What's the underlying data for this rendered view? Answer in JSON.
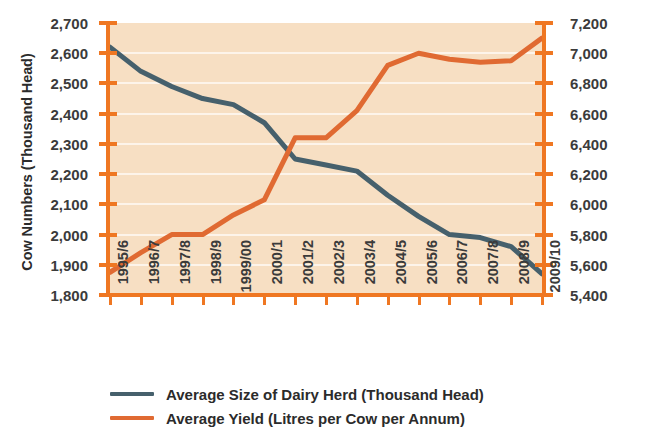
{
  "chart_data": {
    "type": "line",
    "title": "",
    "xlabel": "",
    "ylabel": "Cow Numbers (Thousand Head)",
    "y2label": "",
    "grid": true,
    "legend_position": "bottom-left",
    "plot_background": "#f7dfc3",
    "gridline_color": "#fdf4ea",
    "axis_color": "#ef7722",
    "categories": [
      "1995/6",
      "1996/7",
      "1997/8",
      "1998/9",
      "1999/00",
      "2000/1",
      "2001/2",
      "2002/3",
      "2003/4",
      "2004/5",
      "2005/6",
      "2006/7",
      "2007/8",
      "2008/9",
      "2009/10"
    ],
    "left_axis": {
      "label": "Cow Numbers (Thousand Head)",
      "ylim": [
        1800,
        2700
      ],
      "tick_step": 100,
      "ticks": [
        2700,
        2600,
        2500,
        2400,
        2300,
        2200,
        2100,
        2000,
        1900,
        1800
      ],
      "tick_labels": [
        "2,700",
        "2,600",
        "2,500",
        "2,400",
        "2,300",
        "2,200",
        "2,100",
        "2,000",
        "1,900",
        "1,800"
      ]
    },
    "right_axis": {
      "label": "",
      "ylim": [
        5400,
        7200
      ],
      "tick_step": 200,
      "ticks": [
        7200,
        7000,
        6800,
        6600,
        6400,
        6200,
        6000,
        5800,
        5600,
        5400
      ],
      "tick_labels": [
        "7,200",
        "7,000",
        "6,800",
        "6,600",
        "6,400",
        "6,200",
        "6,000",
        "5,800",
        "5,600",
        "5,400"
      ]
    },
    "series": [
      {
        "name": "Average Size of Dairy Herd (Thousand Head)",
        "axis": "left",
        "color": "#46606c",
        "values": [
          2620,
          2540,
          2490,
          2450,
          2430,
          2370,
          2250,
          2230,
          2210,
          2130,
          2060,
          2000,
          1990,
          1960,
          1870
        ]
      },
      {
        "name": "Average Yield (Litres per Cow per Annum)",
        "axis": "right",
        "color": "#e06a32",
        "values": [
          5550,
          5680,
          5800,
          5800,
          5930,
          6030,
          6440,
          6440,
          6620,
          6920,
          7000,
          6960,
          6940,
          6950,
          7100
        ]
      }
    ]
  },
  "legend": {
    "items": [
      {
        "label": "Average Size of Dairy Herd (Thousand Head)",
        "color": "#46606c"
      },
      {
        "label": "Average Yield (Litres per Cow per Annum)",
        "color": "#e06a32"
      }
    ]
  }
}
